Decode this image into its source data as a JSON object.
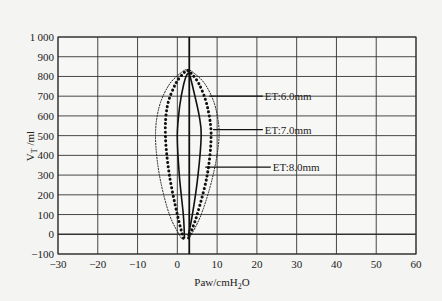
{
  "chart_data": {
    "type": "line",
    "title": "",
    "xlabel": "Paw/cmH2O",
    "ylabel": "VT/ml",
    "xlim": [
      -30,
      60
    ],
    "ylim": [
      -100,
      1000
    ],
    "xticks": [
      -30,
      -20,
      -10,
      0,
      10,
      20,
      30,
      40,
      50,
      60
    ],
    "yticks": [
      -100,
      0,
      100,
      200,
      300,
      400,
      500,
      600,
      700,
      800,
      900,
      1000
    ],
    "grid": true,
    "reference_line_x": 3,
    "series": [
      {
        "name": "ET:6.0mm",
        "style": "dotted-thin",
        "points": [
          [
            1,
            -20
          ],
          [
            -2,
            100
          ],
          [
            -4.5,
            300
          ],
          [
            -5.5,
            500
          ],
          [
            -4.5,
            650
          ],
          [
            -2,
            760
          ],
          [
            1,
            820
          ],
          [
            2.5,
            835
          ],
          [
            4,
            820
          ],
          [
            7,
            760
          ],
          [
            9.5,
            650
          ],
          [
            10.5,
            500
          ],
          [
            9,
            300
          ],
          [
            6,
            100
          ],
          [
            3,
            -20
          ]
        ]
      },
      {
        "name": "ET:7.0mm",
        "style": "dotted-thick",
        "points": [
          [
            1.5,
            -20
          ],
          [
            0,
            100
          ],
          [
            -2,
            300
          ],
          [
            -3,
            500
          ],
          [
            -2.5,
            650
          ],
          [
            -0.5,
            760
          ],
          [
            1.5,
            815
          ],
          [
            2.5,
            830
          ],
          [
            3.5,
            815
          ],
          [
            5.5,
            760
          ],
          [
            7.5,
            650
          ],
          [
            8.5,
            500
          ],
          [
            7.5,
            300
          ],
          [
            5,
            100
          ],
          [
            2.8,
            -20
          ]
        ]
      },
      {
        "name": "ET:8.0mm",
        "style": "solid",
        "points": [
          [
            1.8,
            -20
          ],
          [
            1.5,
            100
          ],
          [
            0.5,
            300
          ],
          [
            0,
            500
          ],
          [
            0.6,
            650
          ],
          [
            1.6,
            760
          ],
          [
            2.6,
            815
          ],
          [
            3.2,
            800
          ],
          [
            4.2,
            720
          ],
          [
            5.5,
            600
          ],
          [
            6,
            500
          ],
          [
            5.2,
            300
          ],
          [
            3.8,
            100
          ],
          [
            2.7,
            -10
          ]
        ]
      }
    ],
    "annotations": [
      {
        "text": "ET:6.0mm",
        "pointer_from": [
          8,
          700
        ],
        "label_at": [
          22,
          700
        ]
      },
      {
        "text": "ET:7.0mm",
        "pointer_from": [
          9,
          530
        ],
        "label_at": [
          22,
          530
        ]
      },
      {
        "text": "ET:8.0mm",
        "pointer_from": [
          7,
          340
        ],
        "label_at": [
          24,
          340
        ]
      }
    ]
  }
}
